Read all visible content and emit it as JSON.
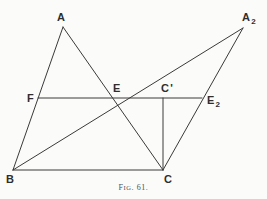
{
  "figure": {
    "caption_prefix": "F",
    "caption_smallcaps": "IG",
    "caption_number": ". 61.",
    "caption_full": "Fig. 61.",
    "background_color": "#fbfbf9",
    "line_color": "#3a3a3a",
    "label_color": "#2e2e2e"
  },
  "points": {
    "A": {
      "label": "A",
      "x": 63,
      "y": 27,
      "label_x": 57,
      "label_y": 12
    },
    "A2": {
      "label": "A",
      "sub": "2",
      "x": 243,
      "y": 28,
      "label_x": 242,
      "label_y": 12
    },
    "B": {
      "label": "B",
      "x": 13,
      "y": 170,
      "label_x": 6,
      "label_y": 174
    },
    "C": {
      "label": "C",
      "x": 163,
      "y": 170,
      "label_x": 164,
      "label_y": 174
    },
    "Cp": {
      "label": "C",
      "prime": "'",
      "x": 163,
      "y": 98,
      "label_x": 161,
      "label_y": 83
    },
    "E": {
      "label": "E",
      "x": 117,
      "y": 98,
      "label_x": 113,
      "label_y": 83
    },
    "E2": {
      "label": "E",
      "sub": "2",
      "x": 202,
      "y": 98,
      "label_x": 207,
      "label_y": 95
    },
    "F": {
      "label": "F",
      "x": 38,
      "y": 98,
      "label_x": 27,
      "label_y": 93
    }
  },
  "segments": [
    {
      "name": "segment-A-B",
      "from": "A",
      "to": "B"
    },
    {
      "name": "segment-A-C",
      "from": "A",
      "to": "C"
    },
    {
      "name": "segment-B-C",
      "from": "B",
      "to": "C"
    },
    {
      "name": "segment-B-A2",
      "from": "B",
      "to": "A2"
    },
    {
      "name": "segment-C-A2",
      "from": "C",
      "to": "A2"
    },
    {
      "name": "segment-F-E2",
      "from": "F",
      "to": "E2"
    },
    {
      "name": "segment-Cp-C",
      "from": "Cp",
      "to": "C"
    }
  ]
}
